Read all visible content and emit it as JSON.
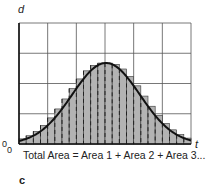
{
  "figure": {
    "panel_label": "c",
    "y_axis_label": "d",
    "x_axis_label": "t",
    "origin_labels": [
      "0",
      "0"
    ],
    "caption": "Total Area = Area 1 + Area 2 + Area 3..."
  },
  "grid": {
    "columns": 6,
    "rows": 4,
    "left": 19,
    "top": 23,
    "right": 191,
    "bottom": 144
  },
  "curve": {
    "type": "bell",
    "peak_x": 106,
    "peak_y": 63,
    "sigma_px": 34
  },
  "bars": {
    "count": 24,
    "fill": "#b3b3b3",
    "divider_style": "dashed"
  },
  "colors": {
    "grid_line": "#555555",
    "curve": "#111111",
    "bar_fill": "#b3b3b3",
    "bar_edge": "#333333"
  }
}
